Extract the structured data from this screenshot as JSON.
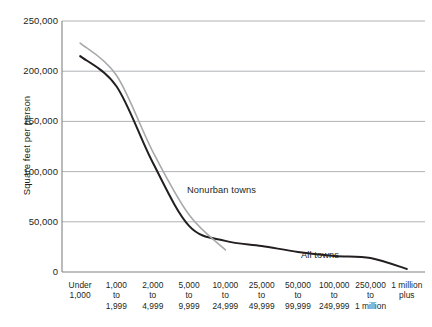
{
  "chart_data": {
    "type": "line",
    "title": "",
    "xlabel": "",
    "ylabel": "Square feet per person",
    "ylim": [
      0,
      250000
    ],
    "yticks": [
      0,
      50000,
      100000,
      150000,
      200000,
      250000
    ],
    "ytick_labels": [
      "0",
      "50,000",
      "100,000",
      "150,000",
      "200,000",
      "250,000"
    ],
    "grid": true,
    "legend_position": "inline-annotation",
    "categories": [
      "Under 1,000",
      "1,000 to 1,999",
      "2,000 to 4,999",
      "5,000 to 9,999",
      "10,000 to 24,999",
      "25,000 to 49,999",
      "50,000 to 99,999",
      "100,000 to 249,999",
      "250,000 to 1 million",
      "1 million plus"
    ],
    "category_lines": [
      [
        "Under",
        "1,000"
      ],
      [
        "1,000",
        "to",
        "1,999"
      ],
      [
        "2,000",
        "to",
        "4,999"
      ],
      [
        "5,000",
        "to",
        "9,999"
      ],
      [
        "10,000",
        "to",
        "24,999"
      ],
      [
        "25,000",
        "to",
        "49,999"
      ],
      [
        "50,000",
        "to",
        "99,999"
      ],
      [
        "100,000",
        "to",
        "249,999"
      ],
      [
        "250,000",
        "to",
        "1 million"
      ],
      [
        "1 million",
        "plus"
      ]
    ],
    "series": [
      {
        "name": "All towns",
        "color": "#231f20",
        "values": [
          215000,
          185000,
          109000,
          46000,
          31000,
          26000,
          20000,
          16000,
          14000,
          3000
        ]
      },
      {
        "name": "Nonurban towns",
        "color": "#a7a9ac",
        "values": [
          228000,
          196000,
          120000,
          57000,
          22000,
          null,
          null,
          null,
          null,
          null
        ]
      }
    ],
    "annotations": [
      {
        "text": "Nonurban towns",
        "series": "Nonurban towns"
      },
      {
        "text": "All towns",
        "series": "All towns"
      }
    ]
  }
}
